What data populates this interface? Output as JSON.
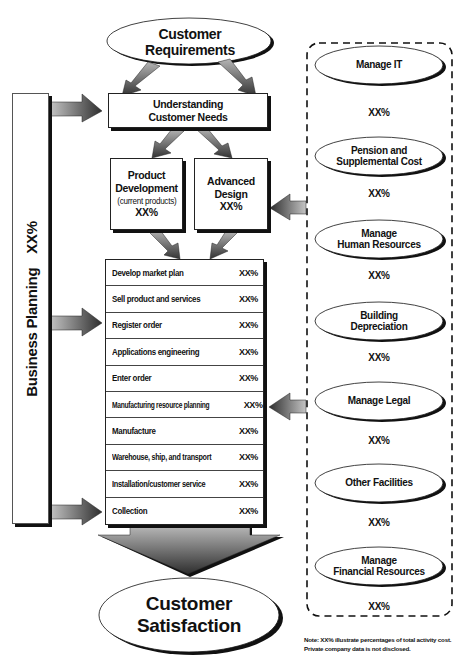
{
  "diagram": {
    "title": "",
    "customer_requirements": {
      "line1": "Customer",
      "line2": "Requirements"
    },
    "understanding_needs": {
      "line1": "Understanding",
      "line2": "Customer Needs"
    },
    "product_development": {
      "line1": "Product",
      "line2": "Development",
      "line3": "(current products)",
      "pct": "XX%"
    },
    "advanced_design": {
      "line1": "Advanced",
      "line2": "Design",
      "pct": "XX%"
    },
    "business_planning": {
      "label": "Business Planning",
      "pct": "XX%"
    },
    "activities": [
      {
        "label": "Develop market plan",
        "pct": "XX%"
      },
      {
        "label": "Sell product and services",
        "pct": "XX%"
      },
      {
        "label": "Register order",
        "pct": "XX%"
      },
      {
        "label": "Applications engineering",
        "pct": "XX%"
      },
      {
        "label": "Enter order",
        "pct": "XX%"
      },
      {
        "label": "Manufacturing resource planning",
        "pct": "XX%"
      },
      {
        "label": "Manufacture",
        "pct": "XX%"
      },
      {
        "label": "Warehouse, ship, and transport",
        "pct": "XX%"
      },
      {
        "label": "Installation/customer service",
        "pct": "XX%"
      },
      {
        "label": "Collection",
        "pct": "XX%"
      }
    ],
    "customer_satisfaction": {
      "line1": "Customer",
      "line2": "Satisfaction"
    },
    "support_activities": [
      {
        "line1": "Manage IT",
        "line2": "",
        "pct": "XX%"
      },
      {
        "line1": "Pension and",
        "line2": "Supplemental Cost",
        "pct": "XX%"
      },
      {
        "line1": "Manage",
        "line2": "Human Resources",
        "pct": "XX%"
      },
      {
        "line1": "Building",
        "line2": "Depreciation",
        "pct": "XX%"
      },
      {
        "line1": "Manage Legal",
        "line2": "",
        "pct": "XX%"
      },
      {
        "line1": "Other Facilities",
        "line2": "",
        "pct": "XX%"
      },
      {
        "line1": "Manage",
        "line2": "Financial Resources",
        "pct": "XX%"
      }
    ],
    "note": {
      "line1": "Note: XX% illustrate percentages of total activity cost.",
      "line2": "Private company data is not disclosed."
    }
  },
  "colors": {
    "line": "#111111",
    "arrow_dark": "#3a3a3a",
    "arrow_light": "#b0b0b0",
    "background": "#ffffff"
  }
}
